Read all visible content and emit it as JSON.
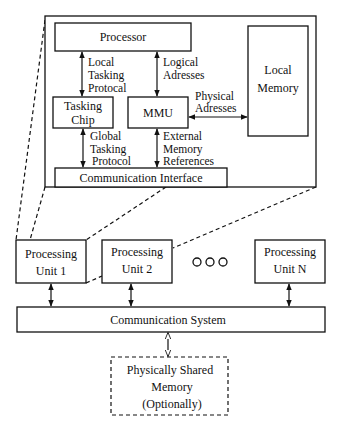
{
  "diagram": {
    "processing_unit_detail": {
      "processor": "Processor",
      "local_memory": [
        "Local",
        "Memory"
      ],
      "tasking_chip": [
        "Tasking",
        "Chip"
      ],
      "mmu": "MMU",
      "communication_interface": "Communication Interface",
      "edges": {
        "local_tasking_protocol": [
          "Local",
          "Tasking",
          "Protocal"
        ],
        "logical_addresses": [
          "Logical",
          "Adresses"
        ],
        "physical_addresses": [
          "Physical",
          "Adresses"
        ],
        "global_tasking_protocol": [
          "Global",
          "Tasking",
          "Protocol"
        ],
        "external_memory_references": [
          "External",
          "Memory",
          "References"
        ]
      }
    },
    "processing_units": [
      {
        "line1": "Processing",
        "line2": "Unit 1"
      },
      {
        "line1": "Processing",
        "line2": "Unit 2"
      },
      {
        "line1": "Processing",
        "line2": "Unit N"
      }
    ],
    "ellipsis": "ooo",
    "communication_system": "Communication System",
    "shared_memory": [
      "Physically Shared",
      "Memory",
      "(Optionally)"
    ]
  }
}
